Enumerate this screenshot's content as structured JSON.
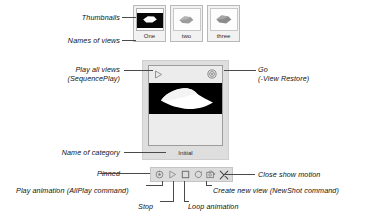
{
  "annotations": {
    "thumbnails": "Thumbnails",
    "names_of_views": "Names of views",
    "play_all_views_line1": "Play all views",
    "play_all_views_line2": "(SequencePlay)",
    "go_line1": "Go",
    "go_line2": "(-View Restore)",
    "name_of_category": "Name of category",
    "pinned": "Pinned",
    "play_animation": "Play animation (AllPlay command)",
    "stop": "Stop",
    "loop_animation": "Loop animation",
    "create_new_view": "Create new view (NewShot command)",
    "close_show_motion": "Close show motion"
  },
  "thumbnails": {
    "items": [
      {
        "name": "One",
        "icon": "view-thumbnail-selected"
      },
      {
        "name": "two",
        "icon": "view-thumbnail"
      },
      {
        "name": "three",
        "icon": "view-thumbnail"
      }
    ]
  },
  "panel": {
    "play_all_icon": "play-outline-icon",
    "go_icon": "go-target-icon",
    "preview_icon": "shot-preview-image",
    "category": "Initial"
  },
  "toolbar": {
    "buttons": [
      {
        "name": "pinned",
        "icon": "pin-icon"
      },
      {
        "name": "play-animation",
        "icon": "play-icon"
      },
      {
        "name": "stop",
        "icon": "stop-square-icon"
      },
      {
        "name": "loop-animation",
        "icon": "loop-arrow-icon"
      },
      {
        "name": "create-new-view",
        "icon": "new-shot-camera-icon"
      },
      {
        "name": "close-show-motion",
        "icon": "close-x-icon"
      }
    ]
  },
  "colors": {
    "panel_bg": "#dedede",
    "panel_inner_bg": "#ececec",
    "canvas_bg": "#000000",
    "toolbar_bg": "#dcdcdc",
    "line": "#4a4a4a",
    "text": "#111111"
  }
}
